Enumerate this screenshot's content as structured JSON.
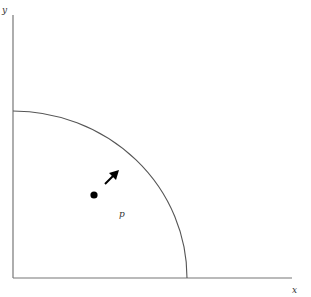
{
  "diagram": {
    "axes": {
      "x_label": "x",
      "y_label": "y"
    },
    "region_boundary": "quarter-circle arc",
    "point_label": "p",
    "arrow_direction": "up-right",
    "colors": {
      "axis": "#777777",
      "arc": "#555555",
      "point": "#000000",
      "arrow": "#000000"
    }
  }
}
